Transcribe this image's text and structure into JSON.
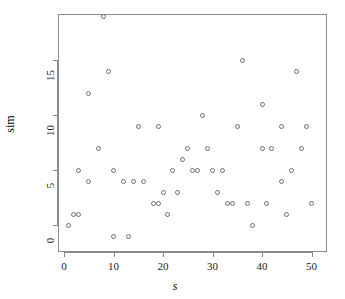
{
  "chart_data": {
    "type": "scatter",
    "title": "",
    "xlabel": "s",
    "ylabel": "sim",
    "xlim": [
      0,
      51
    ],
    "ylim": [
      -1,
      19
    ],
    "grid": false,
    "legend": null,
    "xticks": [
      0,
      10,
      20,
      30,
      40,
      50
    ],
    "yticks": [
      0,
      5,
      10,
      15
    ],
    "xtick_labels": [
      "0",
      "10",
      "20",
      "30",
      "40",
      "50"
    ],
    "ytick_labels": [
      "0",
      "5",
      "10",
      "15"
    ],
    "marker": "open-circle",
    "marker_color": "#6e6e6e",
    "points": [
      {
        "x": 1,
        "y": 0
      },
      {
        "x": 2,
        "y": 1
      },
      {
        "x": 3,
        "y": 1
      },
      {
        "x": 3,
        "y": 5
      },
      {
        "x": 5,
        "y": 4
      },
      {
        "x": 5,
        "y": 12
      },
      {
        "x": 7,
        "y": 7
      },
      {
        "x": 8,
        "y": 19
      },
      {
        "x": 9,
        "y": 14
      },
      {
        "x": 10,
        "y": 5
      },
      {
        "x": 10,
        "y": -1
      },
      {
        "x": 12,
        "y": 4
      },
      {
        "x": 13,
        "y": -1
      },
      {
        "x": 14,
        "y": 4
      },
      {
        "x": 15,
        "y": 9
      },
      {
        "x": 16,
        "y": 4
      },
      {
        "x": 18,
        "y": 2
      },
      {
        "x": 19,
        "y": 2
      },
      {
        "x": 19,
        "y": 9
      },
      {
        "x": 20,
        "y": 3
      },
      {
        "x": 21,
        "y": 1
      },
      {
        "x": 22,
        "y": 5
      },
      {
        "x": 23,
        "y": 3
      },
      {
        "x": 24,
        "y": 6
      },
      {
        "x": 25,
        "y": 7
      },
      {
        "x": 26,
        "y": 5
      },
      {
        "x": 27,
        "y": 5
      },
      {
        "x": 28,
        "y": 10
      },
      {
        "x": 29,
        "y": 7
      },
      {
        "x": 30,
        "y": 5
      },
      {
        "x": 31,
        "y": 3
      },
      {
        "x": 32,
        "y": 5
      },
      {
        "x": 33,
        "y": 2
      },
      {
        "x": 34,
        "y": 2
      },
      {
        "x": 35,
        "y": 9
      },
      {
        "x": 36,
        "y": 15
      },
      {
        "x": 37,
        "y": 2
      },
      {
        "x": 38,
        "y": 0
      },
      {
        "x": 40,
        "y": 11
      },
      {
        "x": 40,
        "y": 7
      },
      {
        "x": 41,
        "y": 2
      },
      {
        "x": 42,
        "y": 7
      },
      {
        "x": 44,
        "y": 4
      },
      {
        "x": 44,
        "y": 9
      },
      {
        "x": 45,
        "y": 1
      },
      {
        "x": 46,
        "y": 5
      },
      {
        "x": 47,
        "y": 14
      },
      {
        "x": 48,
        "y": 7
      },
      {
        "x": 49,
        "y": 9
      },
      {
        "x": 50,
        "y": 2
      }
    ]
  }
}
